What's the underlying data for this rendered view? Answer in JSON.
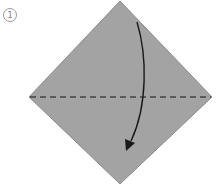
{
  "step": {
    "number": "1"
  },
  "diagram": {
    "paper_color": "#a3a3a3",
    "paper_edge_color": "#8c8c8c",
    "fold_line_color": "#444444",
    "arrow_color": "#1a1a1a",
    "fold_type": "valley-fold",
    "fold_direction": "top corner down to bottom corner"
  }
}
